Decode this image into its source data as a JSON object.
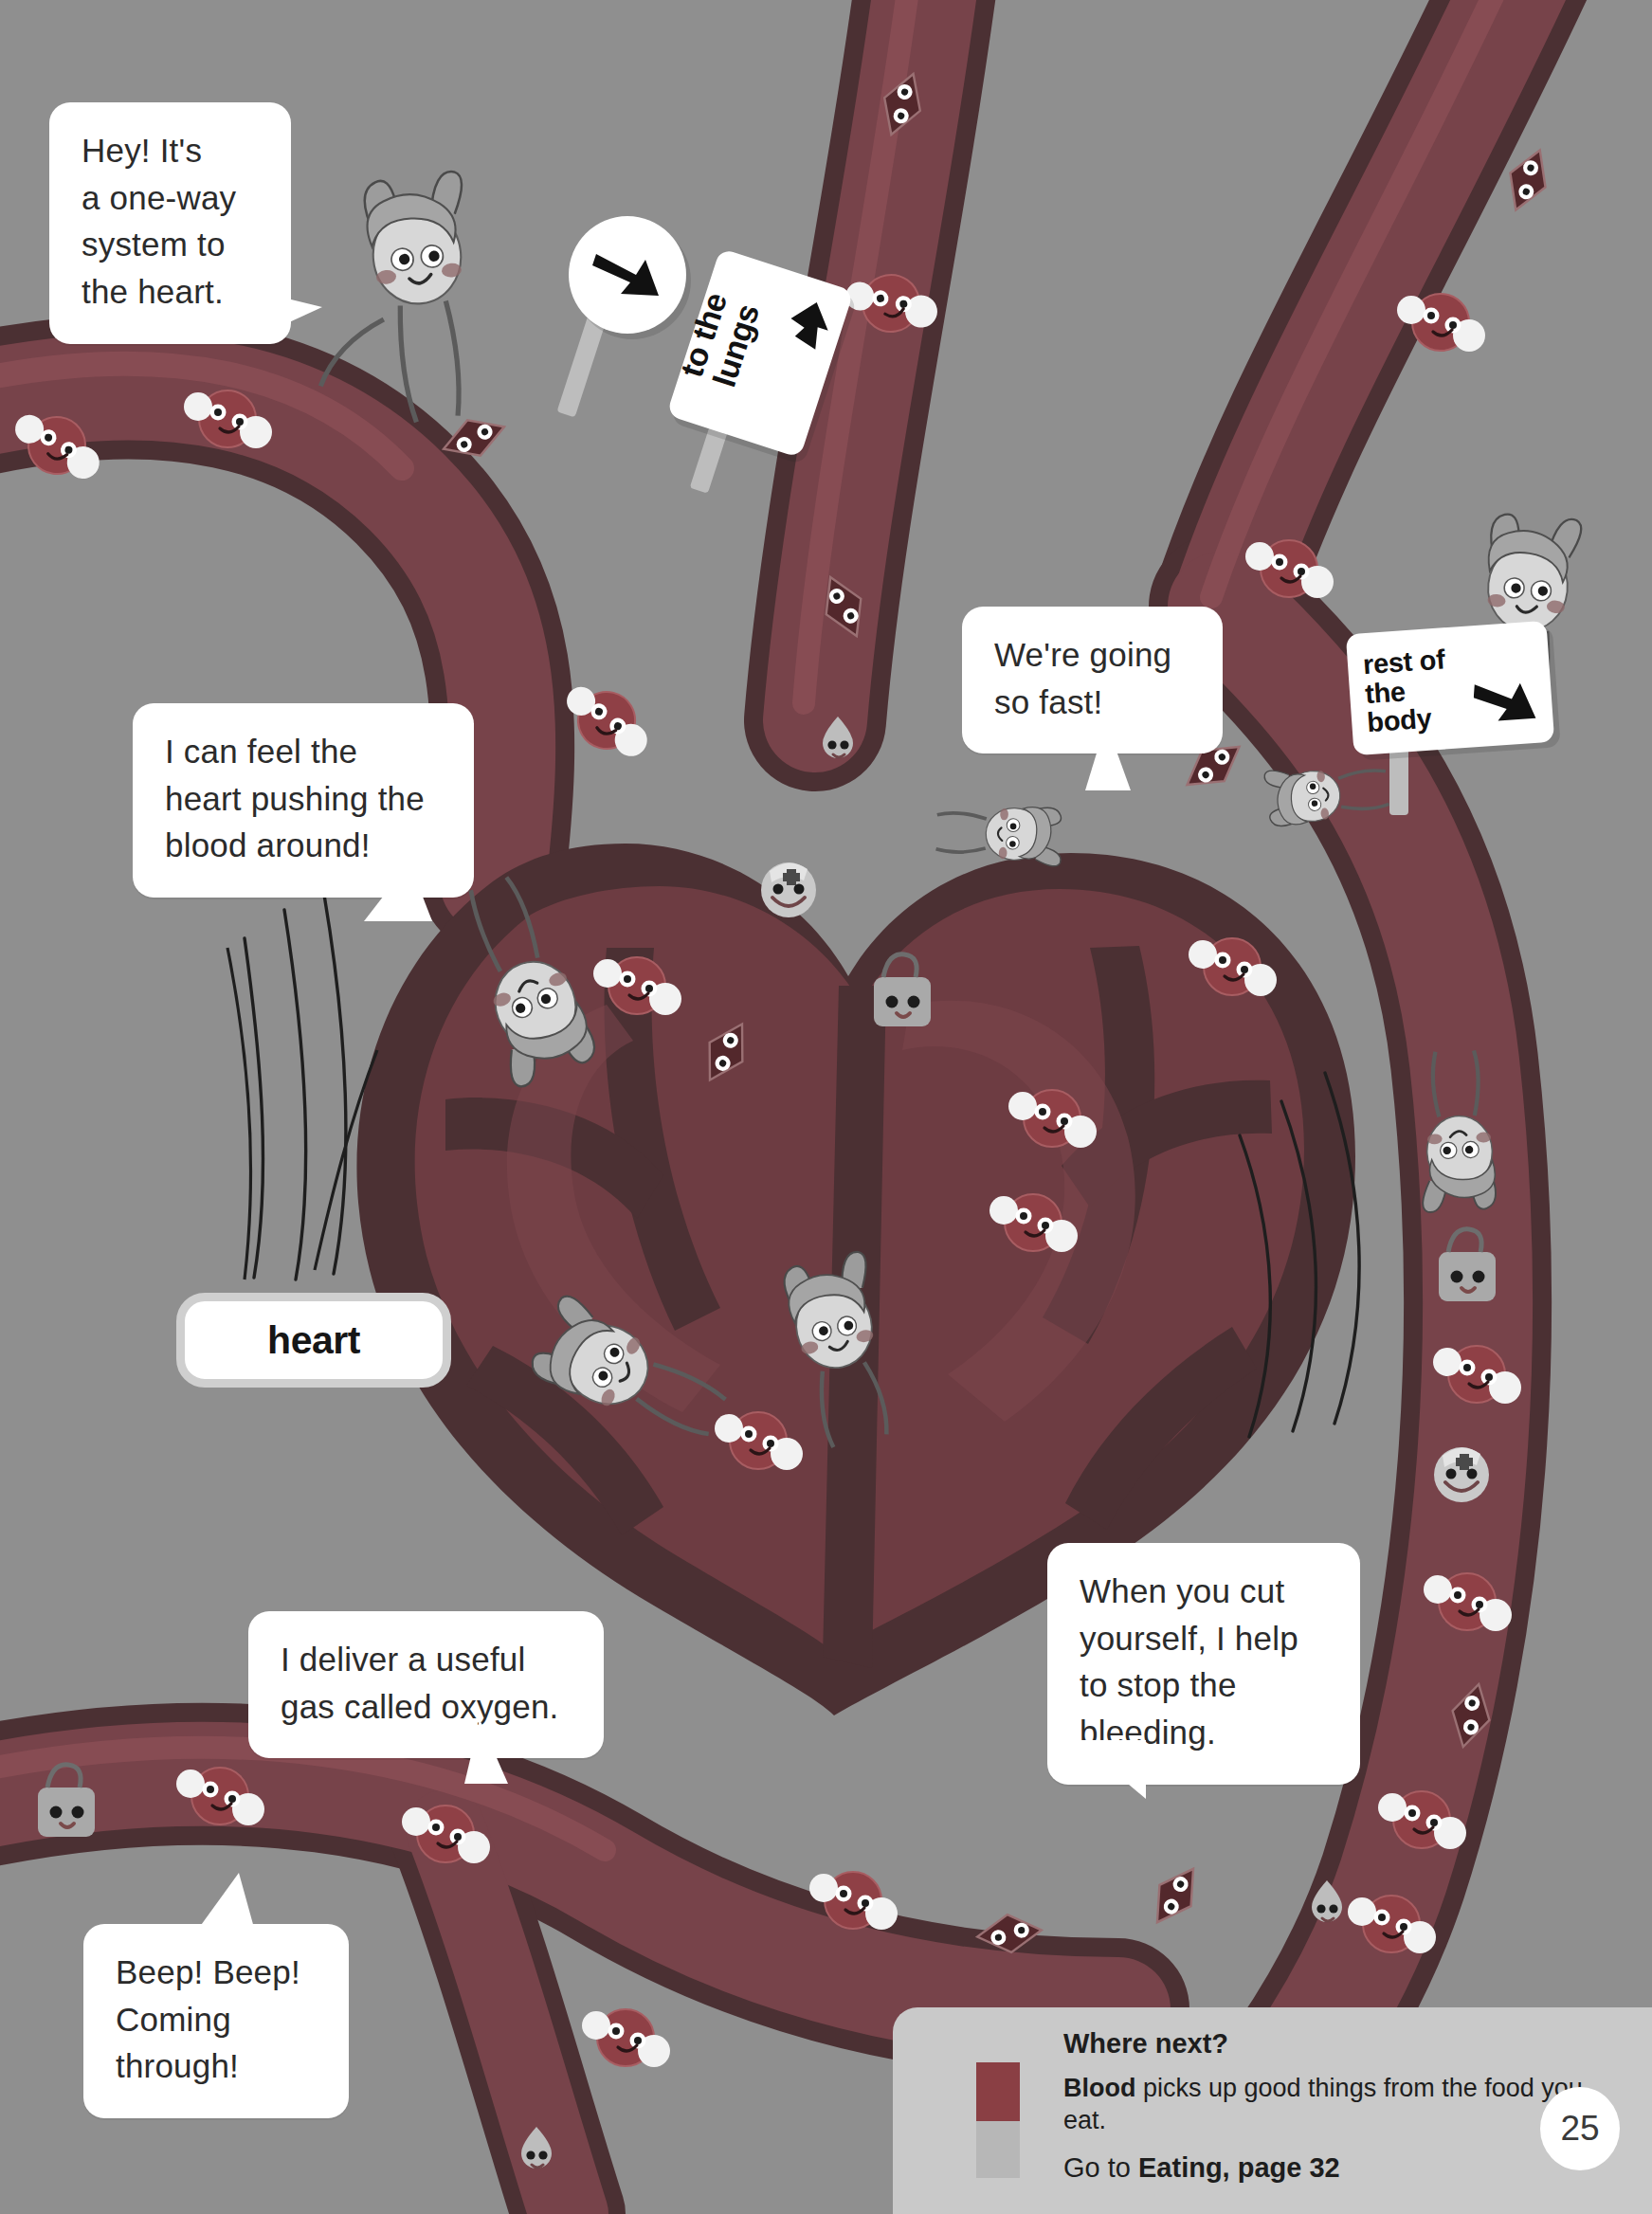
{
  "page": {
    "number": "25",
    "background_color": "#8f8f8f",
    "topic": "Blood and the heart"
  },
  "speech_bubbles": [
    {
      "id": "one-way",
      "text": "Hey! It's\na one-way\nsystem to\nthe heart."
    },
    {
      "id": "heart-push",
      "text": "I can feel the\nheart pushing the\nblood around!"
    },
    {
      "id": "so-fast",
      "text": "We're going\nso fast!"
    },
    {
      "id": "oxygen",
      "text": "I deliver a useful\ngas called oxygen."
    },
    {
      "id": "bleeding",
      "text": "When you cut\nyourself, I help\nto stop the\nbleeding."
    },
    {
      "id": "beep",
      "text": "Beep! Beep!\nComing\nthrough!"
    }
  ],
  "signs": [
    {
      "id": "to-the-lungs",
      "text": "to the\nlungs",
      "arrow": "up-arrow-icon"
    },
    {
      "id": "rest-of-body",
      "text": "rest of\nthe\nbody",
      "arrow": "down-right-arrow-icon"
    },
    {
      "id": "round-arrow",
      "text": "",
      "arrow": "down-right-arrow-icon"
    }
  ],
  "labels": [
    {
      "id": "heart",
      "text": "heart"
    }
  ],
  "where_next": {
    "title": "Where next?",
    "body_bold": "Blood",
    "body_rest": " picks up good things from the food you eat.",
    "goto_prefix": "Go to ",
    "goto_target": "Eating, page 32",
    "swatch_colors": [
      "#8a3f44",
      "#b7b7b7"
    ]
  },
  "colors": {
    "background": "#8f8f8f",
    "vessel_dark_outline": "#4b3033",
    "vessel_artery": "#6e3b40",
    "vessel_fill": "#7c4449",
    "heart_chamber": "#6a3a3f",
    "heart_inner": "#5a3135",
    "bubble_white": "#ffffff",
    "ink": "#2b2b2b"
  },
  "characters": [
    {
      "id": "kid-bunny-hood",
      "name": "child-in-bunny-hood"
    },
    {
      "id": "kid-cat-hood",
      "name": "child-in-cat-hood"
    },
    {
      "id": "kid-rabbit-right",
      "name": "child-in-rabbit-hood"
    },
    {
      "id": "red-blood-cell",
      "name": "red-blood-cell-with-oxygen-bubbles"
    },
    {
      "id": "platelet",
      "name": "platelet-diamond"
    },
    {
      "id": "white-blood-cell",
      "name": "white-blood-cell-bag"
    },
    {
      "id": "nurse-cell",
      "name": "nurse-cell-with-cross"
    },
    {
      "id": "flame-cell",
      "name": "drop-shaped-cell"
    }
  ]
}
